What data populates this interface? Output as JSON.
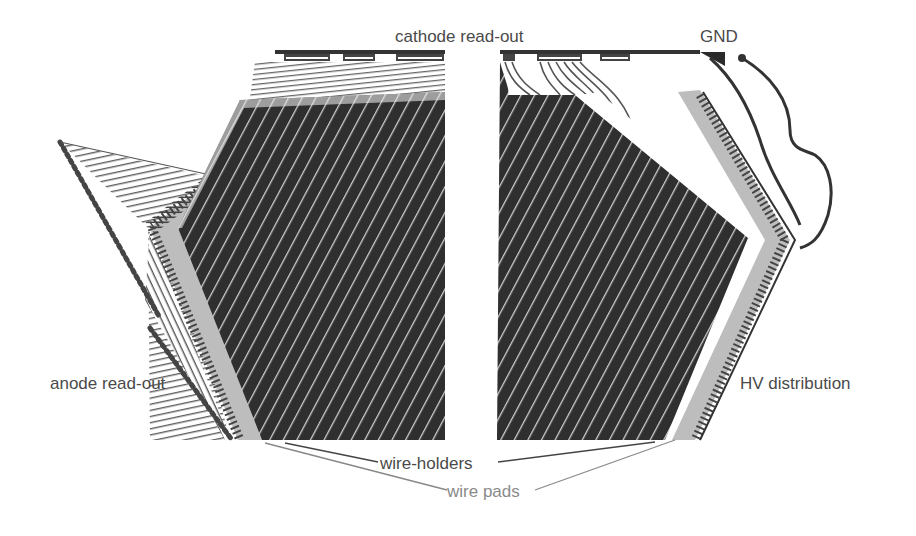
{
  "diagram": {
    "labels": {
      "cathode_readout": "cathode read-out",
      "gnd": "GND",
      "anode_readout": "anode read-out",
      "hv_distribution": "HV distribution",
      "wire_holders": "wire-holders",
      "wire_pads": "wire pads"
    },
    "colors": {
      "background": "#ffffff",
      "wire_plane": "#2f2f2f",
      "wire_gap": "#d8d8d8",
      "holder_strip": "#bdbdbd",
      "trace": "#3a3a3a",
      "label_text": "#4a4a4a",
      "label_text_light": "#8a8a8a"
    },
    "components": [
      {
        "name": "left wire plane",
        "region": "left"
      },
      {
        "name": "right wire plane",
        "region": "right"
      },
      {
        "name": "cathode read-out bus",
        "region": "top"
      },
      {
        "name": "GND connection",
        "region": "top-right"
      },
      {
        "name": "anode read-out fan",
        "region": "left"
      },
      {
        "name": "HV distribution traces",
        "region": "right"
      },
      {
        "name": "wire-holders",
        "region": "bottom"
      },
      {
        "name": "wire pads",
        "region": "bottom"
      }
    ]
  }
}
